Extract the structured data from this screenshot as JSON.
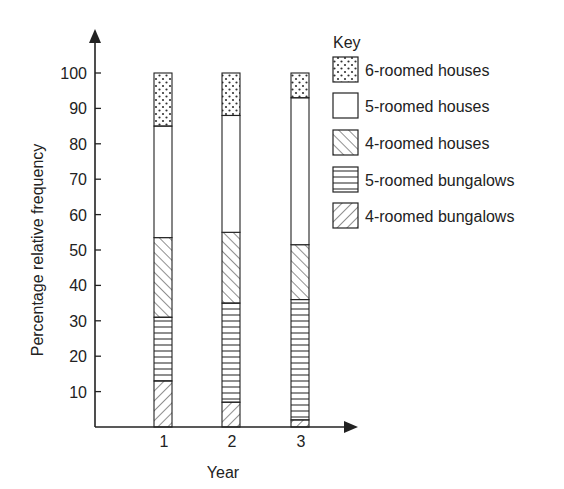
{
  "chart_data": {
    "type": "bar",
    "stacked": true,
    "title": "",
    "xlabel": "Year",
    "ylabel": "Percentage relative frequency",
    "ylim": [
      0,
      100
    ],
    "yticks": [
      10,
      20,
      30,
      40,
      50,
      60,
      70,
      80,
      90,
      100
    ],
    "categories": [
      "1",
      "2",
      "3"
    ],
    "grid": false,
    "legend_title": "Key",
    "legend_position": "right",
    "series": [
      {
        "name": "4-roomed bungalows",
        "pattern": "diagonal-forward",
        "values": [
          13,
          7,
          2
        ]
      },
      {
        "name": "5-roomed bungalows",
        "pattern": "horizontal",
        "values": [
          18,
          28,
          34
        ]
      },
      {
        "name": "4-roomed houses",
        "pattern": "diagonal-backward",
        "values": [
          22.5,
          20,
          15.5
        ]
      },
      {
        "name": "5-roomed houses",
        "pattern": "blank",
        "values": [
          31.5,
          33,
          41.5
        ]
      },
      {
        "name": "6-roomed houses",
        "pattern": "dotted",
        "values": [
          15,
          12,
          7
        ]
      }
    ],
    "legend_order": [
      "6-roomed houses",
      "5-roomed houses",
      "4-roomed houses",
      "5-roomed bungalows",
      "4-roomed bungalows"
    ]
  },
  "colors": {
    "ink": "#222222",
    "background": "#ffffff"
  }
}
